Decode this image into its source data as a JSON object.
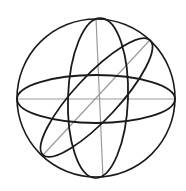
{
  "diagram": {
    "title": "",
    "colors": {
      "background": "#ffffff",
      "outline": "#1a1a1a",
      "axis": "#9a9a9a"
    },
    "sphere": {
      "cx": 96,
      "cy": 98,
      "r": 79
    },
    "ellipses": [
      {
        "name": "equator-ellipse",
        "cx": 96,
        "cy": 99,
        "rx": 79,
        "ry": 24,
        "rotate": 0
      },
      {
        "name": "meridian-ellipse",
        "cx": 98,
        "cy": 98,
        "rx": 30,
        "ry": 80,
        "rotate": 2
      },
      {
        "name": "tilted-ellipse",
        "cx": 96.5,
        "cy": 97.5,
        "rx": 78.5,
        "ry": 22,
        "rotate": -47
      }
    ],
    "axes": [
      {
        "name": "horizontal-axis",
        "x1": 17,
        "y1": 99,
        "x2": 175,
        "y2": 99
      },
      {
        "name": "vertical-axis",
        "x1": 96,
        "y1": 18,
        "x2": 103,
        "y2": 178
      },
      {
        "name": "diagonal-axis",
        "x1": 150,
        "y1": 40,
        "x2": 43,
        "y2": 155
      }
    ]
  }
}
